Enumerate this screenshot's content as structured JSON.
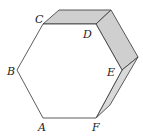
{
  "diagram": {
    "type": "hexagonal-prism",
    "labels": {
      "A": "A",
      "B": "B",
      "C": "C",
      "D": "D",
      "E": "E",
      "F": "F"
    },
    "colors": {
      "stroke": "#333333",
      "face_fill": "#ffffff",
      "side_fill": "#cfcfcf"
    }
  }
}
